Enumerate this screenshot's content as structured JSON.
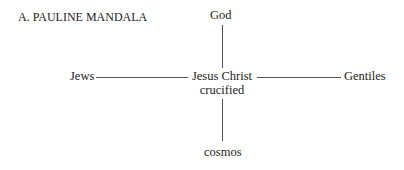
{
  "title": "A. PAULINE MANDALA",
  "nodes": {
    "top": "God",
    "left": "Jews",
    "center_line1": "Jesus Christ",
    "center_line2": "crucified",
    "right": "Gentiles",
    "bottom": "cosmos"
  },
  "colors": {
    "text": "#222222",
    "lines": "#555555",
    "background": "#ffffff"
  }
}
